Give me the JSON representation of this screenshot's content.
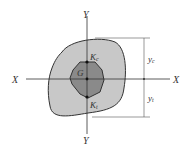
{
  "diagram": {
    "labels": {
      "y_top": "Y",
      "y_bottom": "Y",
      "x_left": "X",
      "x_right": "X",
      "centroid": "G",
      "kc_main": "K",
      "kc_sub": "c",
      "kt_main": "K",
      "kt_sub": "t",
      "yc_main": "y",
      "yc_sub": "c",
      "yt_main": "y",
      "yt_sub": "t"
    },
    "colors": {
      "outer_fill": "#c8c8c8",
      "inner_fill": "#8a8a8a",
      "stroke": "#333333"
    }
  }
}
